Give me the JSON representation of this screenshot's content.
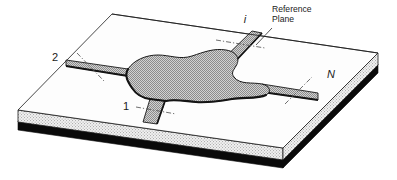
{
  "figure": {
    "background_color": "#ffffff"
  },
  "annotations": {
    "reference_plane": {
      "line_1": "Reference",
      "line_2": "Plane",
      "x": 272,
      "y": 12
    }
  },
  "ports": [
    {
      "id": "port-1",
      "label": "1",
      "italic": false,
      "label_x": 126,
      "label_y": 110,
      "description": "bottom-left port stub"
    },
    {
      "id": "port-2",
      "label": "2",
      "italic": false,
      "label_x": 55,
      "label_y": 61,
      "description": "left port stub"
    },
    {
      "id": "port-i",
      "label": "i",
      "italic": true,
      "label_x": 245,
      "label_y": 23,
      "description": "top port stub"
    },
    {
      "id": "port-N",
      "label": "N",
      "italic": true,
      "label_x": 331,
      "label_y": 78,
      "description": "right port stub"
    }
  ],
  "colors": {
    "outline": "#1a1a1a",
    "substrate_top": "#fdfdfd",
    "substrate_side": "#d8d8d8",
    "ground_plane": "#0a0a0a",
    "metal_fill": "#b9b9b9",
    "metal_shadow": "#141414",
    "leader_line": "#3a3a3a",
    "reference_dash": "#555555"
  },
  "geometry": {
    "substrate_top_face": "112,14 378,53 283,148 18,110",
    "substrate_front_face": "18,110 283,148 283,162 18,124",
    "substrate_right_face": "283,148 378,53 378,67 283,162",
    "ground_plane_front": "18,122 283,160 283,167 18,129",
    "ground_plane_right": "283,160 378,65 378,72 283,167"
  }
}
